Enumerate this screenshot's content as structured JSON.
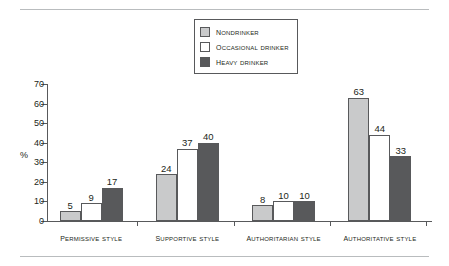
{
  "rules": {
    "color": "#b9bcbe"
  },
  "legend": {
    "position": "top-center",
    "items": [
      {
        "label": "Nondrinker",
        "color": "#c9cacb",
        "swatch_name": "legend-swatch-nondrinker"
      },
      {
        "label": "Occasional drinker",
        "color": "#ffffff",
        "swatch_name": "legend-swatch-occasional-drinker"
      },
      {
        "label": "Heavy drinker",
        "color": "#58595b",
        "swatch_name": "legend-swatch-heavy-drinker"
      }
    ]
  },
  "axis": {
    "ylabel": "%",
    "yticks": [
      0,
      10,
      20,
      30,
      40,
      50,
      60,
      70
    ]
  },
  "chart_data": {
    "type": "bar",
    "title": "",
    "subtitle": "",
    "xlabel": "",
    "ylabel": "%",
    "ylim": [
      0,
      70
    ],
    "ytick_step": 10,
    "grid": false,
    "legend_position": "top-center",
    "categories": [
      "Permissive style",
      "Supportive style",
      "Authoritarian style",
      "Authoritative style"
    ],
    "series": [
      {
        "name": "Nondrinker",
        "color": "#c9cacb",
        "values": [
          5,
          24,
          8,
          63
        ]
      },
      {
        "name": "Occasional drinker",
        "color": "#ffffff",
        "values": [
          9,
          37,
          10,
          44
        ]
      },
      {
        "name": "Heavy drinker",
        "color": "#58595b",
        "values": [
          17,
          40,
          10,
          33
        ]
      }
    ]
  }
}
